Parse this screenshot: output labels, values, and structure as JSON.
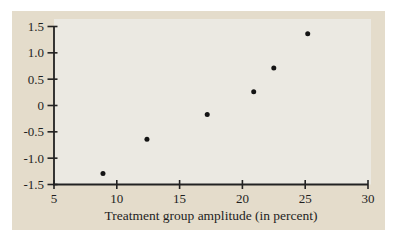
{
  "figure": {
    "background_color": "#e4dccb",
    "plot_background_color": "#ebe9e2",
    "axis_color": "#222222",
    "point_color": "#141414",
    "text_color": "#1e1e1e"
  },
  "chart_data": {
    "type": "scatter",
    "title": "",
    "xlabel": "Treatment group amplitude (in percent)",
    "ylabel": "",
    "xlim": [
      5,
      30
    ],
    "ylim": [
      -1.5,
      1.5
    ],
    "x_ticks": [
      5,
      10,
      15,
      20,
      25,
      30
    ],
    "x_tick_labels": [
      "5",
      "10",
      "15",
      "20",
      "25",
      "30"
    ],
    "y_ticks": [
      -1.5,
      -1.0,
      -0.5,
      0,
      0.5,
      1.0,
      1.5
    ],
    "y_tick_labels": [
      "-1.5",
      "-1.0",
      "-0.5",
      "0",
      "0.5",
      "1.0",
      "1.5"
    ],
    "grid": false,
    "legend": null,
    "points": [
      {
        "x": 8.9,
        "y": -1.29
      },
      {
        "x": 12.4,
        "y": -0.64
      },
      {
        "x": 17.2,
        "y": -0.17
      },
      {
        "x": 20.9,
        "y": 0.26
      },
      {
        "x": 22.5,
        "y": 0.71
      },
      {
        "x": 25.2,
        "y": 1.36
      }
    ]
  }
}
